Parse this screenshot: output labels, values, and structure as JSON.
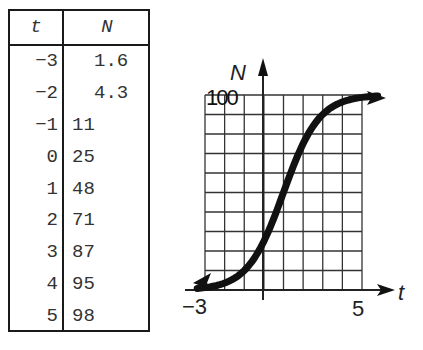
{
  "table": {
    "headers": [
      "t",
      "N"
    ],
    "rows": [
      {
        "t": "−3",
        "N": "1.6"
      },
      {
        "t": "−2",
        "N": "4.3"
      },
      {
        "t": "−1",
        "N": "11"
      },
      {
        "t": "0",
        "N": "25"
      },
      {
        "t": "1",
        "N": "48"
      },
      {
        "t": "2",
        "N": "71"
      },
      {
        "t": "3",
        "N": "87"
      },
      {
        "t": "4",
        "N": "95"
      },
      {
        "t": "5",
        "N": "98"
      }
    ]
  },
  "chart": {
    "ylabel": "N",
    "xlabel": "t",
    "y_tick_top": "100",
    "x_tick_left": "−3",
    "x_tick_right": "5"
  },
  "chart_data": {
    "type": "line",
    "title": "",
    "xlabel": "t",
    "ylabel": "N",
    "x": [
      -3,
      -2,
      -1,
      0,
      1,
      2,
      3,
      4,
      5
    ],
    "series": [
      {
        "name": "N",
        "values": [
          1.6,
          4.3,
          11,
          25,
          48,
          71,
          87,
          95,
          98
        ]
      }
    ],
    "xlim": [
      -3,
      5
    ],
    "ylim": [
      0,
      100
    ],
    "grid": true,
    "grid_x_step": 1,
    "grid_y_step": 10,
    "legend": "none",
    "x_tick_labels": [
      "−3",
      "5"
    ],
    "y_tick_labels": [
      "100"
    ]
  }
}
